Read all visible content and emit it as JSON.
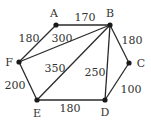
{
  "graph": {
    "nodes": [
      {
        "id": "A",
        "label": "A",
        "x": 56,
        "y": 25,
        "lx": 54,
        "ly": 17
      },
      {
        "id": "B",
        "label": "B",
        "x": 110,
        "y": 25,
        "lx": 110,
        "ly": 17
      },
      {
        "id": "C",
        "label": "C",
        "x": 129,
        "y": 63,
        "lx": 141,
        "ly": 67
      },
      {
        "id": "D",
        "label": "D",
        "x": 105,
        "y": 100,
        "lx": 105,
        "ly": 116
      },
      {
        "id": "E",
        "label": "E",
        "x": 37,
        "y": 100,
        "lx": 37,
        "ly": 117
      },
      {
        "id": "F",
        "label": "F",
        "x": 19,
        "y": 62,
        "lx": 9,
        "ly": 66
      }
    ],
    "edges": [
      {
        "from": "A",
        "to": "B",
        "weight": "170",
        "wx": 85,
        "wy": 21
      },
      {
        "from": "A",
        "to": "F",
        "weight": "180",
        "wx": 29,
        "wy": 42
      },
      {
        "from": "F",
        "to": "B",
        "weight": "300",
        "wx": 62,
        "wy": 42
      },
      {
        "from": "E",
        "to": "B",
        "weight": "350",
        "wx": 55,
        "wy": 72
      },
      {
        "from": "B",
        "to": "D",
        "weight": "250",
        "wx": 95,
        "wy": 76
      },
      {
        "from": "B",
        "to": "C",
        "weight": "180",
        "wx": 132,
        "wy": 44
      },
      {
        "from": "C",
        "to": "D",
        "weight": "100",
        "wx": 131,
        "wy": 93
      },
      {
        "from": "E",
        "to": "D",
        "weight": "180",
        "wx": 70,
        "wy": 112
      },
      {
        "from": "F",
        "to": "E",
        "weight": "200",
        "wx": 15,
        "wy": 89
      }
    ]
  }
}
